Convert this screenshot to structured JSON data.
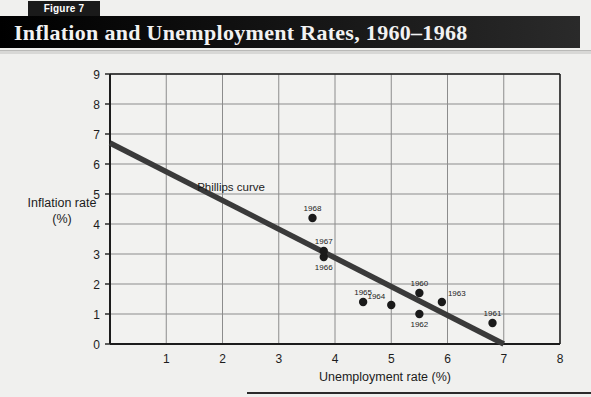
{
  "figure": {
    "badge_label": "Figure 7",
    "title": "Inflation and Unemployment Rates, 1960–1968"
  },
  "colors": {
    "header_bar": "#111111",
    "badge_bg": "#1a1a1a",
    "badge_text": "#ffffff",
    "title_text": "#f2f2f2",
    "page_bg": "#f0f0ee",
    "plot_bg": "#f2f2f0",
    "grid": "#8c8c8c",
    "axis": "#1c1c1c",
    "series_line": "#3a3a3a",
    "point": "#1a1a1a"
  },
  "chart_data": {
    "type": "scatter",
    "title": "Inflation and Unemployment Rates, 1960–1968",
    "xlabel": "Unemployment rate (%)",
    "ylabel": "Inflation rate (%)",
    "ylabel_line1": "Inflation rate",
    "ylabel_line2": "(%)",
    "xlim": [
      0,
      8
    ],
    "ylim": [
      0,
      9
    ],
    "xticks": [
      0,
      1,
      2,
      3,
      4,
      5,
      6,
      7,
      8
    ],
    "yticks": [
      0,
      1,
      2,
      3,
      4,
      5,
      6,
      7,
      8,
      9
    ],
    "grid": true,
    "legend": "none",
    "annotations": [
      {
        "text": "Phillips curve",
        "x": 1.55,
        "y": 5.1
      }
    ],
    "series": [
      {
        "name": "Annual observations",
        "type": "scatter",
        "labels": [
          "1960",
          "1961",
          "1962",
          "1963",
          "1964",
          "1965",
          "1966",
          "1967",
          "1968"
        ],
        "points": [
          {
            "label": "1960",
            "x": 5.5,
            "y": 1.7,
            "label_pos": "above"
          },
          {
            "label": "1961",
            "x": 6.8,
            "y": 0.7,
            "label_pos": "above"
          },
          {
            "label": "1962",
            "x": 5.5,
            "y": 1.0,
            "label_pos": "below"
          },
          {
            "label": "1963",
            "x": 5.9,
            "y": 1.4,
            "label_pos": "above-right"
          },
          {
            "label": "1964",
            "x": 5.0,
            "y": 1.3,
            "label_pos": "above-left"
          },
          {
            "label": "1965",
            "x": 4.5,
            "y": 1.4,
            "label_pos": "above"
          },
          {
            "label": "1966",
            "x": 3.8,
            "y": 2.9,
            "label_pos": "below"
          },
          {
            "label": "1967",
            "x": 3.8,
            "y": 3.1,
            "label_pos": "above"
          },
          {
            "label": "1968",
            "x": 3.6,
            "y": 4.2,
            "label_pos": "above"
          }
        ]
      },
      {
        "name": "Phillips curve",
        "type": "line",
        "points": [
          {
            "x": 0.0,
            "y": 6.7
          },
          {
            "x": 7.0,
            "y": 0.0
          }
        ]
      }
    ]
  }
}
